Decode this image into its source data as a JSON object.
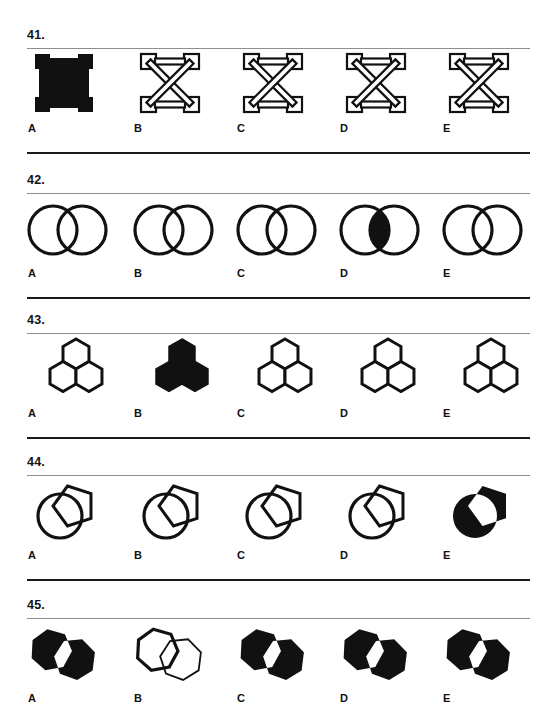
{
  "page": {
    "width": 553,
    "height": 705,
    "background": "#ffffff",
    "ink": "#111111",
    "rule_top_color": "#8e8e8e",
    "rule_bottom_color": "#1a1a1a",
    "document_type": "multiple-choice figural reasoning test page"
  },
  "questions": [
    {
      "number": "41.",
      "shape": "square-frame-with-x-cross",
      "top": 28,
      "options": [
        {
          "label": "A",
          "variant": "solid-filled"
        },
        {
          "label": "B",
          "variant": "outline"
        },
        {
          "label": "C",
          "variant": "outline"
        },
        {
          "label": "D",
          "variant": "outline"
        },
        {
          "label": "E",
          "variant": "outline"
        }
      ]
    },
    {
      "number": "42.",
      "shape": "two-overlapping-circles",
      "top": 173,
      "options": [
        {
          "label": "A",
          "variant": "outline"
        },
        {
          "label": "B",
          "variant": "outline"
        },
        {
          "label": "C",
          "variant": "outline"
        },
        {
          "label": "D",
          "variant": "intersection-filled"
        },
        {
          "label": "E",
          "variant": "outline"
        }
      ]
    },
    {
      "number": "43.",
      "shape": "three-hexagon-cluster",
      "top": 313,
      "options": [
        {
          "label": "A",
          "variant": "outline"
        },
        {
          "label": "B",
          "variant": "solid-filled"
        },
        {
          "label": "C",
          "variant": "outline"
        },
        {
          "label": "D",
          "variant": "outline"
        },
        {
          "label": "E",
          "variant": "outline"
        }
      ]
    },
    {
      "number": "44.",
      "shape": "circle-overlapping-pentagon",
      "top": 455,
      "options": [
        {
          "label": "A",
          "variant": "outline"
        },
        {
          "label": "B",
          "variant": "outline"
        },
        {
          "label": "C",
          "variant": "outline"
        },
        {
          "label": "D",
          "variant": "outline"
        },
        {
          "label": "E",
          "variant": "solid-filled-white-overlap"
        }
      ]
    },
    {
      "number": "45.",
      "shape": "two-overlapping-heptagons",
      "top": 598,
      "options": [
        {
          "label": "A",
          "variant": "solid-filled-white-overlap"
        },
        {
          "label": "B",
          "variant": "outline"
        },
        {
          "label": "C",
          "variant": "solid-filled-white-overlap"
        },
        {
          "label": "D",
          "variant": "solid-filled-white-overlap"
        },
        {
          "label": "E",
          "variant": "solid-filled-white-overlap"
        }
      ]
    }
  ],
  "layout": {
    "column_x": [
      27,
      133,
      236,
      339,
      442
    ],
    "rule_left": 27,
    "rule_width": 503,
    "rule_bottom_offset": 124
  }
}
